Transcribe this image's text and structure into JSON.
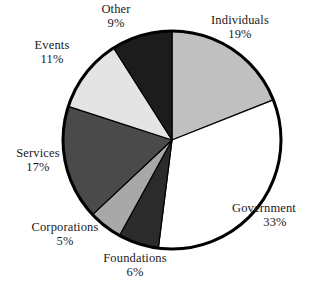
{
  "figure": {
    "background_color": "#ffffff",
    "outline_color": "#000000",
    "text_color": "#1a1a1a"
  },
  "chart_data": {
    "type": "pie",
    "title": "",
    "xlabel": "",
    "ylabel": "",
    "legend_position": "none",
    "grid": false,
    "start_angle_deg": 0,
    "direction": "clockwise",
    "labels_show_percent": true,
    "categories": [
      "Individuals",
      "Government",
      "Foundations",
      "Corporations",
      "Services",
      "Events",
      "Other"
    ],
    "values": [
      19,
      33,
      6,
      5,
      17,
      11,
      9
    ],
    "value_labels": [
      "19%",
      "33%",
      "6%",
      "5%",
      "17%",
      "11%",
      "9%"
    ],
    "colors": [
      "#c0c0c0",
      "#ffffff",
      "#2b2b2b",
      "#a8a8a8",
      "#4a4a4a",
      "#e4e4e4",
      "#1c1c1c"
    ],
    "slices": [
      {
        "name": "Individuals",
        "value": 19,
        "value_label": "19%",
        "color": "#c0c0c0"
      },
      {
        "name": "Government",
        "value": 33,
        "value_label": "33%",
        "color": "#ffffff"
      },
      {
        "name": "Foundations",
        "value": 6,
        "value_label": "6%",
        "color": "#2b2b2b"
      },
      {
        "name": "Corporations",
        "value": 5,
        "value_label": "5%",
        "color": "#a8a8a8"
      },
      {
        "name": "Services",
        "value": 17,
        "value_label": "17%",
        "color": "#4a4a4a"
      },
      {
        "name": "Events",
        "value": 11,
        "value_label": "11%",
        "color": "#e4e4e4"
      },
      {
        "name": "Other",
        "value": 9,
        "value_label": "9%",
        "color": "#1c1c1c"
      }
    ]
  },
  "labels": {
    "other": {
      "name": "Other",
      "value": "9%"
    },
    "individuals": {
      "name": "Individuals",
      "value": "19%"
    },
    "events": {
      "name": "Events",
      "value": "11%"
    },
    "services": {
      "name": "Services",
      "value": "17%"
    },
    "government": {
      "name": "Government",
      "value": "33%"
    },
    "corporations": {
      "name": "Corporations",
      "value": "5%"
    },
    "foundations": {
      "name": "Foundations",
      "value": "6%"
    }
  }
}
